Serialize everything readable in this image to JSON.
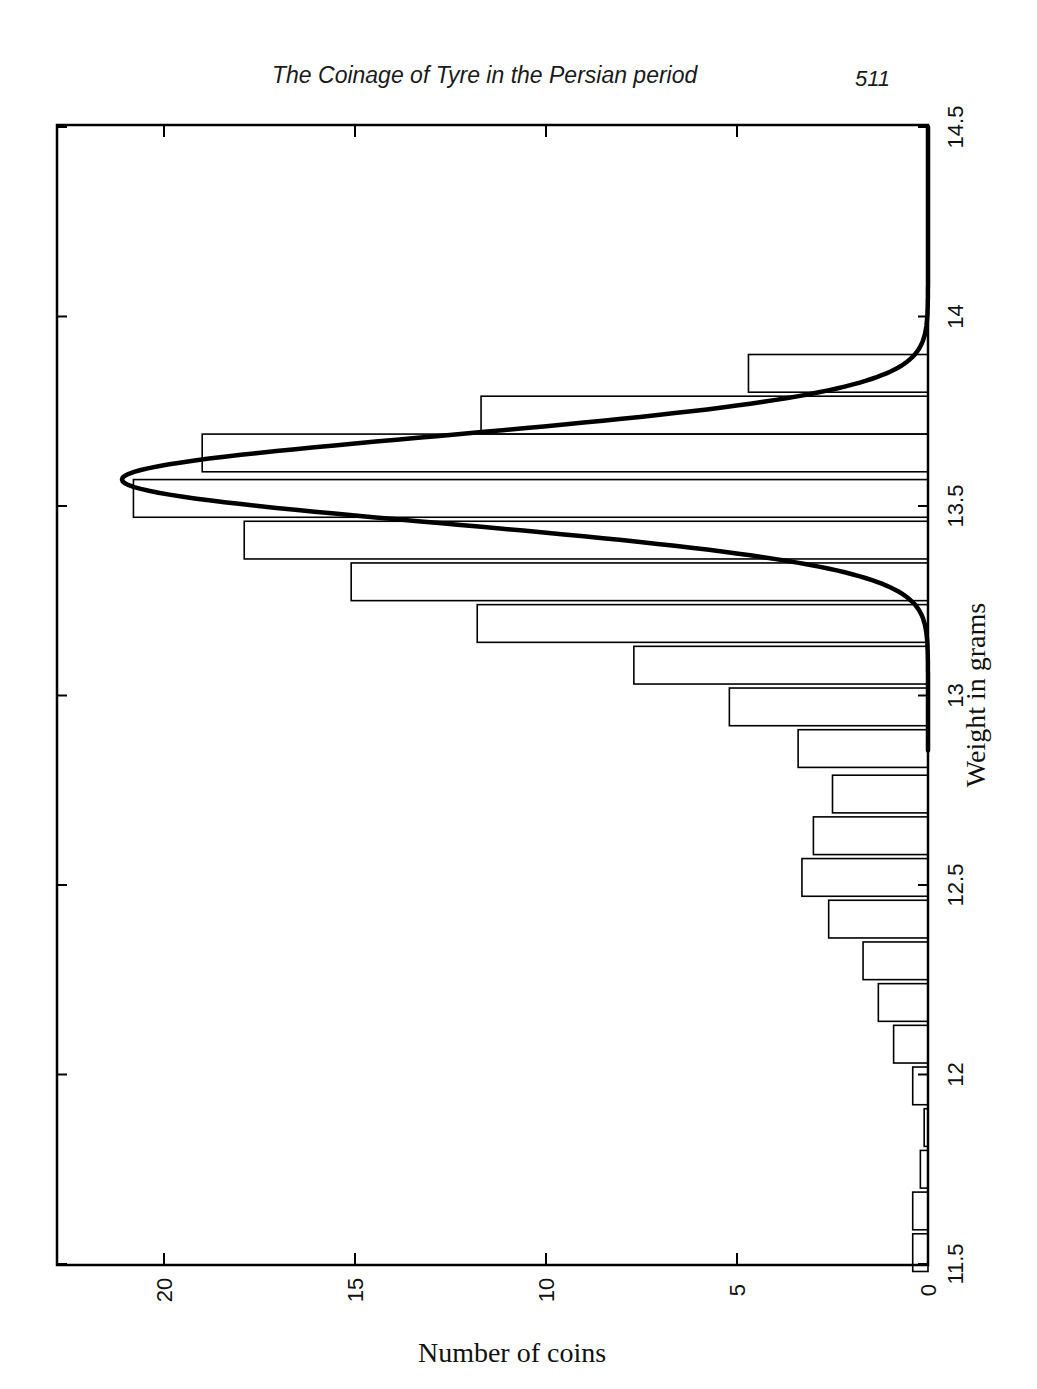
{
  "page": {
    "running_head": "The Coinage of Tyre in the Persian period",
    "page_number": "511"
  },
  "chart_data": {
    "type": "bar",
    "orientation": "rotated 90 degrees clockwise (histogram drawn sideways on page)",
    "title": "",
    "xlabel": "Weight in grams",
    "ylabel": "Number of coins",
    "xlim": [
      11.5,
      14.5
    ],
    "ylim": [
      0,
      22.7
    ],
    "x_ticks": [
      "11.5",
      "12",
      "12.5",
      "13",
      "13.5",
      "14",
      "14.5"
    ],
    "y_ticks": [
      "0",
      "5",
      "10",
      "15",
      "20"
    ],
    "grid": false,
    "legend": null,
    "bin_width": 0.11,
    "categories": [
      11.53,
      11.64,
      11.75,
      11.86,
      11.97,
      12.08,
      12.19,
      12.3,
      12.41,
      12.52,
      12.63,
      12.74,
      12.86,
      12.97,
      13.08,
      13.19,
      13.3,
      13.41,
      13.52,
      13.64,
      13.74,
      13.85
    ],
    "values": [
      0.4,
      0.4,
      0.2,
      0.1,
      0.4,
      0.9,
      1.3,
      1.7,
      2.6,
      3.3,
      3.0,
      2.5,
      3.4,
      5.2,
      7.7,
      11.8,
      15.1,
      17.9,
      20.8,
      19.0,
      11.7,
      4.7
    ],
    "series": [
      {
        "name": "Histogram of coin weights",
        "type": "bar",
        "values": [
          0.4,
          0.4,
          0.2,
          0.1,
          0.4,
          0.9,
          1.3,
          1.7,
          2.6,
          3.3,
          3.0,
          2.5,
          3.4,
          5.2,
          7.7,
          11.8,
          15.1,
          17.9,
          20.8,
          19.0,
          11.7,
          4.7
        ]
      },
      {
        "name": "Fitted normal curve",
        "type": "line",
        "mean": 13.57,
        "peak": 21.1,
        "points": [
          [
            12.9,
            0.0
          ],
          [
            13.0,
            0.1
          ],
          [
            13.1,
            0.6
          ],
          [
            13.2,
            2.1
          ],
          [
            13.3,
            5.9
          ],
          [
            13.4,
            11.3
          ],
          [
            13.5,
            18.5
          ],
          [
            13.57,
            21.1
          ],
          [
            13.65,
            19.6
          ],
          [
            13.7,
            16.8
          ],
          [
            13.8,
            9.0
          ],
          [
            13.9,
            3.0
          ],
          [
            14.0,
            0.7
          ],
          [
            14.1,
            0.1
          ],
          [
            14.2,
            0.0
          ],
          [
            14.5,
            0.0
          ]
        ]
      }
    ]
  }
}
